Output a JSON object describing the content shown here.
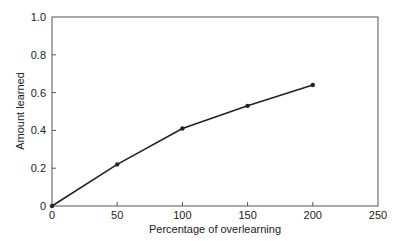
{
  "chart_data": {
    "type": "line",
    "title": "",
    "xlabel": "Percentage of overlearning",
    "ylabel": "Amount learned",
    "xlim": [
      0,
      250
    ],
    "ylim": [
      0,
      1.0
    ],
    "x_ticks": [
      0,
      50,
      100,
      150,
      200,
      250
    ],
    "x_tick_labels": [
      "0",
      "50",
      "100",
      "150",
      "200",
      "250"
    ],
    "y_ticks": [
      0,
      0.2,
      0.4,
      0.6,
      0.8,
      1.0
    ],
    "y_tick_labels": [
      "0",
      "0.2",
      "0.4",
      "0.6",
      "0.8",
      "1.0"
    ],
    "grid": false,
    "legend": null,
    "series": [
      {
        "name": "Amount learned",
        "x": [
          0,
          50,
          100,
          150,
          200
        ],
        "values": [
          0,
          0.22,
          0.41,
          0.53,
          0.64
        ],
        "marker": "circle",
        "color": "#222222"
      }
    ]
  },
  "colors": {
    "line": "#222222",
    "frame": "#555555",
    "text": "#222222"
  }
}
